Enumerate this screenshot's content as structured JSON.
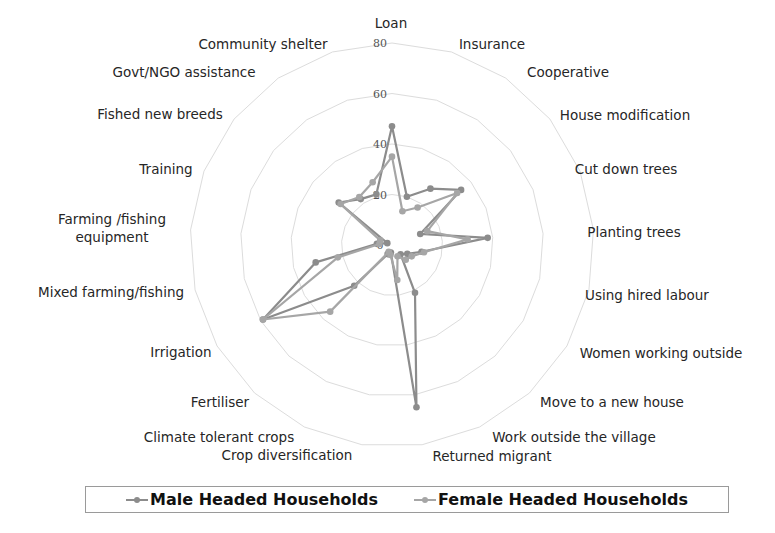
{
  "chart_data": {
    "type": "radar",
    "title": "",
    "categories": [
      "Loan",
      "Insurance",
      "Cooperative",
      "House modification",
      "Cut down trees",
      "Planting trees",
      "Using hired labour",
      "Women working outside",
      "Move to a new house",
      "Work outside the village",
      "Returned migrant",
      "Crop diversification",
      "Climate tolerant crops",
      "Fertiliser",
      "Irrigation",
      "Mixed farming/fishing",
      "Farming /fishing equipment",
      "Training",
      "Fished new breeds",
      "Govt/NGO assistance",
      "Community shelter"
    ],
    "series": [
      {
        "name": "Male Headed Households",
        "color": "#8c8c8c",
        "values": [
          47,
          20,
          27,
          35,
          12,
          38,
          12,
          7,
          5,
          21,
          65,
          3,
          4,
          22,
          59,
          31,
          6,
          2,
          27,
          22,
          21
        ]
      },
      {
        "name": "Female Headed Households",
        "color": "#a6a6a6",
        "values": [
          35,
          14,
          18,
          33,
          15,
          30,
          13,
          9,
          8,
          5,
          14,
          4,
          3,
          36,
          59,
          22,
          5,
          5,
          26,
          23,
          26
        ]
      }
    ],
    "radial_ticks": [
      0,
      20,
      40,
      60,
      80
    ],
    "rlim": [
      0,
      80
    ],
    "grid": true,
    "legend_position": "bottom"
  },
  "legend": {
    "items": [
      {
        "label": "Male Headed Households",
        "color": "#8c8c8c"
      },
      {
        "label": "Female Headed Households",
        "color": "#a6a6a6"
      }
    ]
  },
  "layout": {
    "cx": 392,
    "cy": 245,
    "radius": 202,
    "label_positions": [
      [
        391,
        28,
        "middle"
      ],
      [
        492,
        49,
        "middle"
      ],
      [
        568,
        77,
        "middle"
      ],
      [
        625,
        120,
        "middle"
      ],
      [
        626,
        174,
        "middle"
      ],
      [
        634,
        237,
        "middle"
      ],
      [
        647,
        300,
        "middle"
      ],
      [
        661,
        358,
        "middle"
      ],
      [
        612,
        407,
        "middle"
      ],
      [
        574,
        442,
        "middle"
      ],
      [
        492,
        461,
        "middle"
      ],
      [
        287,
        460,
        "middle"
      ],
      [
        219,
        442,
        "middle"
      ],
      [
        220,
        407,
        "middle"
      ],
      [
        181,
        357,
        "middle"
      ],
      [
        111,
        297,
        "middle"
      ],
      [
        112,
        224,
        "middle"
      ],
      [
        166,
        174,
        "middle"
      ],
      [
        160,
        119,
        "middle"
      ],
      [
        184,
        77,
        "middle"
      ],
      [
        263,
        49,
        "middle"
      ]
    ]
  }
}
